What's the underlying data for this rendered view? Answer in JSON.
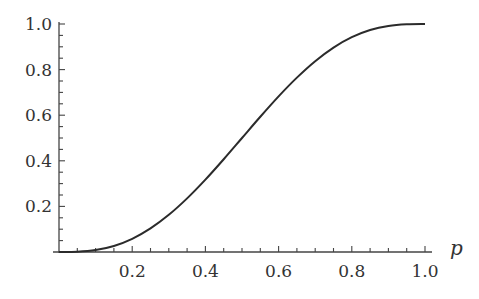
{
  "chart_data": {
    "type": "line",
    "title": "",
    "xlabel": "p",
    "ylabel": "",
    "xlim": [
      0,
      1.0
    ],
    "ylim": [
      0,
      1.0
    ],
    "grid": false,
    "legend": null,
    "x_ticks": [
      "0.2",
      "0.4",
      "0.6",
      "0.8",
      "1.0"
    ],
    "y_ticks": [
      "0.2",
      "0.4",
      "0.6",
      "0.8",
      "1.0"
    ],
    "series": [
      {
        "name": "curve",
        "color": "#2b2b2b",
        "x": [
          0,
          0.05,
          0.1,
          0.15,
          0.2,
          0.25,
          0.3,
          0.35,
          0.4,
          0.45,
          0.5,
          0.55,
          0.6,
          0.65,
          0.7,
          0.75,
          0.8,
          0.85,
          0.9,
          0.95,
          1.0
        ],
        "y": [
          0,
          0.0012,
          0.0086,
          0.0266,
          0.0579,
          0.1035,
          0.1631,
          0.2352,
          0.3174,
          0.4069,
          0.5,
          0.5931,
          0.6826,
          0.7648,
          0.8369,
          0.8965,
          0.9421,
          0.9734,
          0.9914,
          0.9988,
          1.0
        ]
      }
    ]
  },
  "colors": {
    "axis": "#444444",
    "curve": "#2b2b2b",
    "text": "#333333",
    "background": "#ffffff"
  }
}
